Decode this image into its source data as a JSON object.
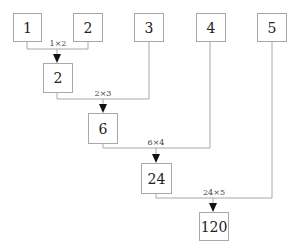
{
  "colors": {
    "line": "#a8a8a8",
    "arrow": "#111111",
    "text": "#222222"
  },
  "inputs": [
    "1",
    "2",
    "3",
    "4",
    "5"
  ],
  "results": [
    "2",
    "6",
    "24",
    "120"
  ],
  "operations": [
    "1×2",
    "2×3",
    "6×4",
    "24×5"
  ]
}
